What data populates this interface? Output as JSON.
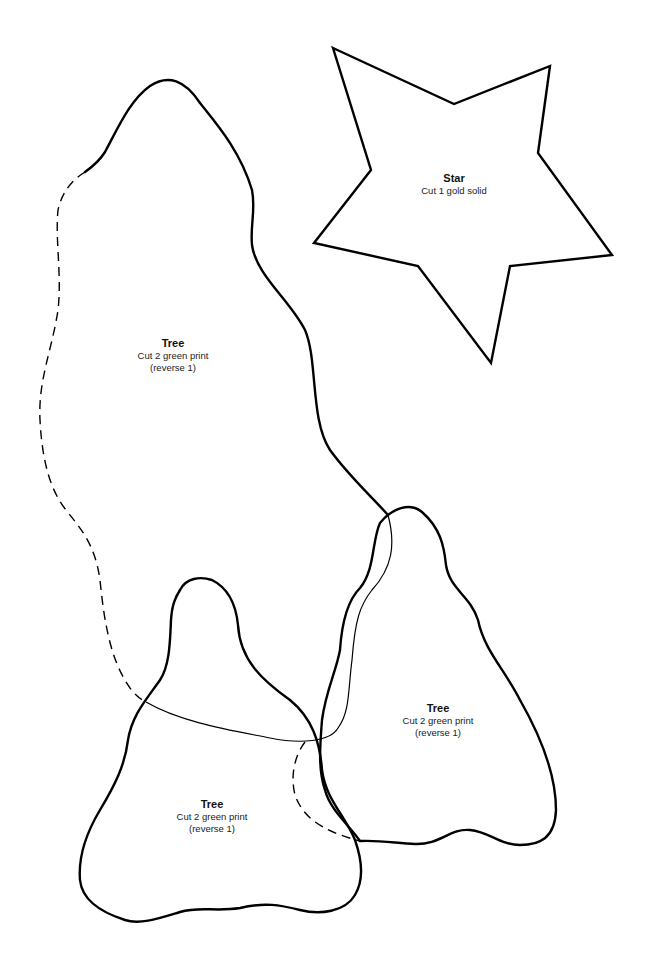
{
  "pattern": {
    "pieces": [
      {
        "id": "star",
        "title": "Star",
        "lines": [
          "Cut 1 gold solid"
        ],
        "pos": {
          "x": 454,
          "y": 172
        }
      },
      {
        "id": "tree-large",
        "title": "Tree",
        "lines": [
          "Cut 2 green print",
          "(reverse 1)"
        ],
        "pos": {
          "x": 173,
          "y": 333
        }
      },
      {
        "id": "tree-right",
        "title": "Tree",
        "lines": [
          "Cut 2 green print",
          "(reverse 1)"
        ],
        "pos": {
          "x": 438,
          "y": 702
        }
      },
      {
        "id": "tree-bottom",
        "title": "Tree",
        "lines": [
          "Cut 2 green print",
          "(reverse 1)"
        ],
        "pos": {
          "x": 213,
          "y": 798
        }
      }
    ],
    "colors": {
      "stroke": "#000000",
      "background": "#ffffff"
    }
  }
}
